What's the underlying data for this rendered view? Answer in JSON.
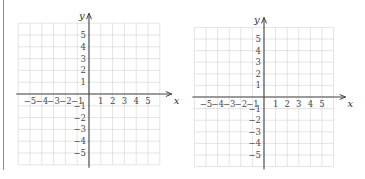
{
  "chart_data": [
    {
      "type": "coordinate-plane",
      "title": "",
      "xlabel": "x",
      "ylabel": "y",
      "xlim": [
        -6,
        6
      ],
      "ylim": [
        -6,
        6
      ],
      "grid": true,
      "x_ticks": [
        -5,
        -4,
        -3,
        -2,
        -1,
        1,
        2,
        3,
        4,
        5
      ],
      "y_ticks": [
        5,
        4,
        3,
        2,
        1,
        -1,
        -2,
        -3,
        -4,
        -5
      ],
      "x_tick_labels": [
        "−5",
        "−4",
        "−3",
        "−2",
        "−1",
        "1",
        "2",
        "3",
        "4",
        "5"
      ],
      "y_tick_labels": [
        "5",
        "4",
        "3",
        "2",
        "1",
        "−1",
        "−2",
        "−3",
        "−4",
        "−5"
      ]
    },
    {
      "type": "coordinate-plane",
      "title": "",
      "xlabel": "x",
      "ylabel": "y",
      "xlim": [
        -6,
        6
      ],
      "ylim": [
        -6,
        6
      ],
      "grid": true,
      "x_ticks": [
        -5,
        -4,
        -3,
        -2,
        -1,
        1,
        2,
        3,
        4,
        5
      ],
      "y_ticks": [
        5,
        4,
        3,
        2,
        1,
        -1,
        -2,
        -3,
        -4,
        -5
      ],
      "x_tick_labels": [
        "−5",
        "−4",
        "−3",
        "−2",
        "−1",
        "1",
        "2",
        "3",
        "4",
        "5"
      ],
      "y_tick_labels": [
        "5",
        "4",
        "3",
        "2",
        "1",
        "−1",
        "−2",
        "−3",
        "−4",
        "−5"
      ]
    }
  ]
}
